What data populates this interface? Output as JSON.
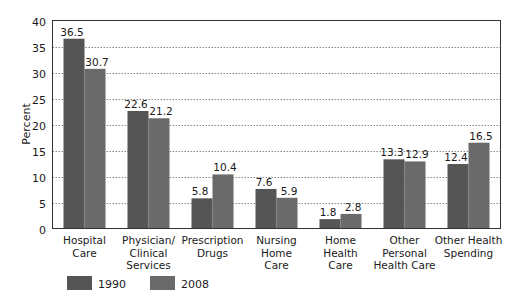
{
  "chart_data": {
    "type": "bar",
    "title": "",
    "xlabel": "",
    "ylabel": "Percent",
    "ylim": [
      0,
      40
    ],
    "yticks": [
      0,
      5,
      10,
      15,
      20,
      25,
      30,
      35,
      40
    ],
    "grid": "horizontal dotted",
    "legend_position": "bottom-left",
    "categories": [
      [
        "Hospital",
        "Care"
      ],
      [
        "Physician/",
        "Clinical",
        "Services"
      ],
      [
        "Prescription",
        "Drugs"
      ],
      [
        "Nursing",
        "Home",
        "Care"
      ],
      [
        "Home",
        "Health",
        "Care"
      ],
      [
        "Other",
        "Personal",
        "Health Care"
      ],
      [
        "Other Health",
        "Spending"
      ]
    ],
    "series": [
      {
        "name": "1990",
        "color": "#555555",
        "values": [
          36.5,
          22.6,
          5.8,
          7.6,
          1.8,
          13.3,
          12.4
        ]
      },
      {
        "name": "2008",
        "color": "#6a6a6a",
        "values": [
          30.7,
          21.2,
          10.4,
          5.9,
          2.8,
          12.9,
          16.5
        ]
      }
    ]
  },
  "legend": {
    "items": [
      {
        "label": "1990",
        "color": "#555555"
      },
      {
        "label": "2008",
        "color": "#6a6a6a"
      }
    ]
  }
}
